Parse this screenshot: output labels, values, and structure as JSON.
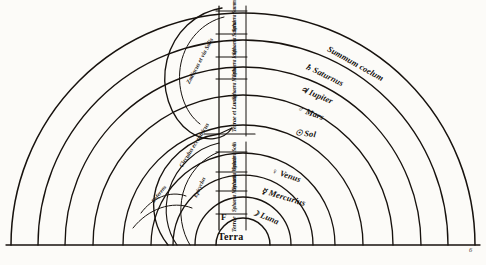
{
  "figure": {
    "page_number": "6",
    "center_label": "Terra",
    "center_mark": "F",
    "ink_color": "#17120e",
    "paper_color": "#fcfbf8"
  },
  "spheres": [
    {
      "id": "coelum",
      "glyph": "",
      "label": "Summum coelum",
      "radius": 232
    },
    {
      "id": "saturn",
      "glyph": "♄",
      "label": "Saturnus",
      "radius": 205
    },
    {
      "id": "jupiter",
      "glyph": "♃",
      "label": "Iupiter",
      "radius": 178
    },
    {
      "id": "mars",
      "glyph": "♂",
      "label": "Mars",
      "radius": 150
    },
    {
      "id": "sol",
      "glyph": "☉",
      "label": "Sol",
      "radius": 120
    },
    {
      "id": "venus",
      "glyph": "♀",
      "label": "Venus",
      "radius": 92
    },
    {
      "id": "mercury",
      "glyph": "☿",
      "label": "Mercurius",
      "radius": 70
    },
    {
      "id": "luna",
      "glyph": "☽",
      "label": "Luna",
      "radius": 48
    },
    {
      "id": "terra",
      "glyph": "",
      "label": "Terra",
      "radius": 27
    }
  ],
  "column": {
    "heading": "Sphaerarum ordo",
    "cells": [
      "Sphaera Summi coeli",
      "Sphaera Saturni",
      "Sphaera Iouis",
      "Sphaera Martis",
      "Terrae et Lunae",
      "Sphaera Solis",
      "Sphaera Veneris",
      "Sphaera Mercurii",
      "Terrae"
    ]
  },
  "oblique_circles": [
    {
      "id": "zodiacus",
      "label": "Zodiacus et via Solis"
    },
    {
      "id": "eccentricus",
      "label": "Circulus eccentricus"
    },
    {
      "id": "epicyclus",
      "label": "Epicyclus"
    },
    {
      "id": "deferens",
      "label": "Deferens"
    }
  ]
}
